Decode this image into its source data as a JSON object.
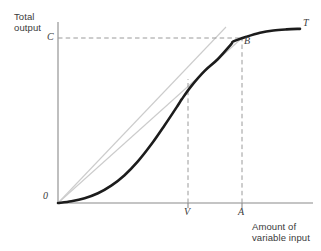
{
  "figure": {
    "kind": "economics-total-product-curve",
    "background_color": "#ffffff",
    "axis_color": "#8a8a8a",
    "curve_color": "#1c1c1c",
    "ray_color": "#c8c8c8",
    "dash_color": "#9a9a9a",
    "text_color": "#3a3a3a"
  },
  "labels": {
    "y_axis_title_line1": "Total",
    "y_axis_title_line2": "output",
    "x_axis_title_line1": "Amount of",
    "x_axis_title_line2": "variable input",
    "origin": "0",
    "output_level_C": "C",
    "curve_name_T": "T",
    "point_B": "B",
    "tick_V": "V",
    "tick_A": "A"
  },
  "chart_data": {
    "type": "line",
    "title": "",
    "xlabel": "Amount of variable input",
    "ylabel": "Total output",
    "grid": false,
    "legend": false,
    "axis_ranges": {
      "x": [
        0,
        1
      ],
      "y": [
        0,
        1
      ]
    },
    "annotations": [
      {
        "name": "origin",
        "label": "0",
        "x": 0.0,
        "y": 0.0
      },
      {
        "name": "output-level-C",
        "label": "C",
        "x": 0.0,
        "y": 0.913
      },
      {
        "name": "inflection-input-V",
        "label": "V",
        "x": 0.512,
        "y": 0.0
      },
      {
        "name": "average-max-input-A",
        "label": "A",
        "x": 0.725,
        "y": 0.0
      },
      {
        "name": "point-B-on-curve",
        "label": "B",
        "x": 0.725,
        "y": 0.913
      },
      {
        "name": "curve-name-T",
        "label": "T",
        "x": 0.969,
        "y": 0.984
      }
    ],
    "series": [
      {
        "name": "Total product curve T",
        "style": "thick-solid-black",
        "points": [
          [
            0.0,
            0.0
          ],
          [
            0.055,
            0.01
          ],
          [
            0.11,
            0.027
          ],
          [
            0.165,
            0.055
          ],
          [
            0.22,
            0.098
          ],
          [
            0.275,
            0.157
          ],
          [
            0.33,
            0.235
          ],
          [
            0.385,
            0.33
          ],
          [
            0.44,
            0.438
          ],
          [
            0.495,
            0.551
          ],
          [
            0.512,
            0.587
          ],
          [
            0.55,
            0.659
          ],
          [
            0.605,
            0.745
          ],
          [
            0.66,
            0.812
          ],
          [
            0.715,
            0.896
          ],
          [
            0.725,
            0.913
          ],
          [
            0.78,
            0.94
          ],
          [
            0.835,
            0.962
          ],
          [
            0.89,
            0.975
          ],
          [
            0.945,
            0.981
          ],
          [
            1.0,
            0.984
          ]
        ]
      },
      {
        "name": "Tangent ray from origin touching curve at V",
        "style": "thin-solid-gray",
        "points": [
          [
            0.0,
            0.0
          ],
          [
            0.661,
            1.0
          ]
        ]
      },
      {
        "name": "Ray from origin through B",
        "style": "thin-solid-gray",
        "points": [
          [
            0.0,
            0.0
          ],
          [
            0.725,
            0.913
          ]
        ]
      },
      {
        "name": "Horizontal guide at output level C",
        "style": "dashed-gray",
        "points": [
          [
            0.0,
            0.913
          ],
          [
            0.725,
            0.913
          ]
        ]
      },
      {
        "name": "Vertical guide at input V",
        "style": "dashed-gray",
        "points": [
          [
            0.512,
            0.0
          ],
          [
            0.512,
            0.61
          ]
        ]
      },
      {
        "name": "Vertical guide at input A",
        "style": "dashed-gray",
        "points": [
          [
            0.725,
            0.0
          ],
          [
            0.725,
            0.913
          ]
        ]
      }
    ]
  }
}
